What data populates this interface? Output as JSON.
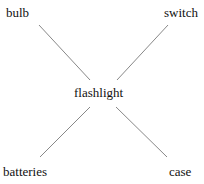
{
  "diagram": {
    "center": {
      "label": "flashlight"
    },
    "nodes": [
      {
        "label": "bulb",
        "position": "top-left"
      },
      {
        "label": "switch",
        "position": "top-right"
      },
      {
        "label": "batteries",
        "position": "bottom-left"
      },
      {
        "label": "case",
        "position": "bottom-right"
      }
    ],
    "edges": [
      [
        "flashlight",
        "bulb"
      ],
      [
        "flashlight",
        "switch"
      ],
      [
        "flashlight",
        "batteries"
      ],
      [
        "flashlight",
        "case"
      ]
    ],
    "line_color": "#888888"
  }
}
